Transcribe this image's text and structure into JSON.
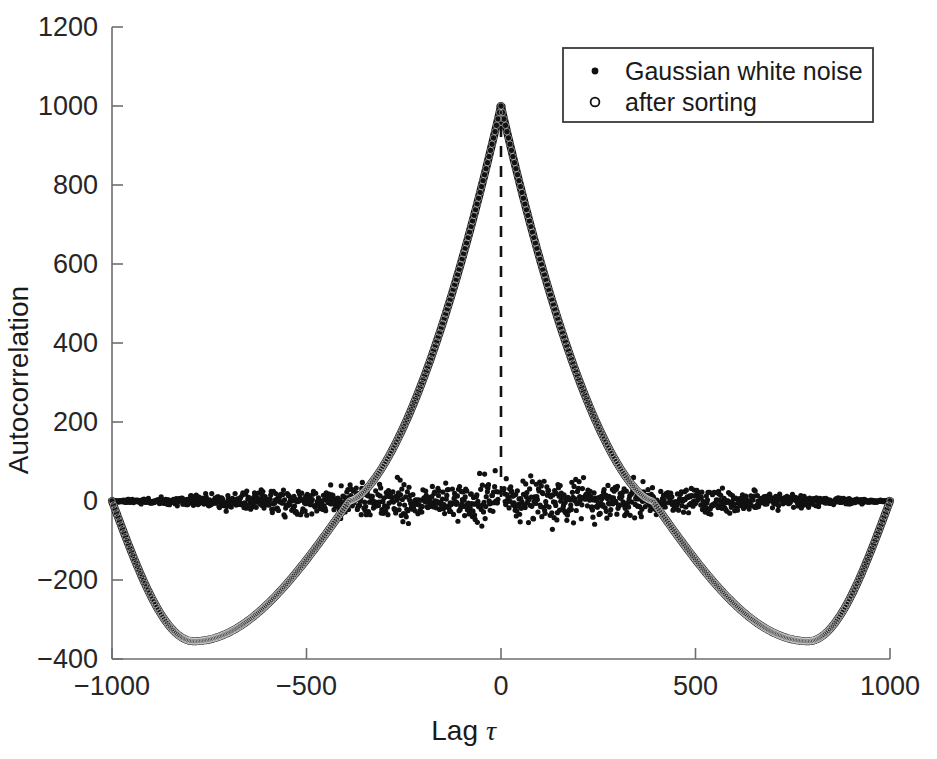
{
  "figure": {
    "background": "#ffffff",
    "ink_color": "#111111",
    "axis_color": "#6e6e6e"
  },
  "chart_data": {
    "type": "scatter",
    "title": "",
    "xlabel_prefix": "Lag",
    "xlabel_symbol": "τ",
    "ylabel": "Autocorrelation",
    "xlim": [
      -1000,
      1000
    ],
    "ylim": [
      -400,
      1200
    ],
    "xticks": [
      -1000,
      -500,
      0,
      500,
      1000
    ],
    "xticklabels": [
      "−1000",
      "−500",
      "0",
      "500",
      "1000"
    ],
    "yticks": [
      -400,
      -200,
      0,
      200,
      400,
      600,
      800,
      1000,
      1200
    ],
    "yticklabels": [
      "−400",
      "−200",
      "0",
      "200",
      "400",
      "600",
      "800",
      "1000",
      "1200"
    ],
    "grid": false,
    "legend_position": "top-right",
    "annotations": [
      {
        "name": "zero-lag-dashed-line",
        "x": 0,
        "y_from": 0,
        "y_to": 1000,
        "style": "dashed"
      }
    ],
    "series": [
      {
        "name": "Gaussian white noise",
        "marker": "filled-dot",
        "marker_size": 3,
        "n_points": 1400,
        "description": "Dense band of scattered points centred on 0, spread roughly ±50, tapering to 0 at the ±1000 edges; narrow spike reaching 1000 at lag 0.",
        "noise_amplitude": 52,
        "peak_value": 1000,
        "peak_lag": 0,
        "baseline": 0
      },
      {
        "name": "after sorting",
        "marker": "open-circle",
        "marker_size": 4,
        "n_points": 520,
        "description": "Smooth triangular-cusp autocorrelation of the sorted ramp: peak 1000 at lag 0, falling steeply, crossing zero near ±390, reaching a minimum of about −355 near lag ±790, returning to 0 at ±1000.",
        "peak_value": 1000,
        "peak_lag": 0,
        "zero_crossings": [
          -390,
          390
        ],
        "minimum_value": -355,
        "minimum_lags": [
          -790,
          790
        ],
        "endpoints_value": 0,
        "key_points": [
          {
            "lag": -1000,
            "value": 0
          },
          {
            "lag": -950,
            "value": -148
          },
          {
            "lag": -900,
            "value": -262
          },
          {
            "lag": -850,
            "value": -326
          },
          {
            "lag": -790,
            "value": -355
          },
          {
            "lag": -700,
            "value": -339
          },
          {
            "lag": -600,
            "value": -276
          },
          {
            "lag": -500,
            "value": -186
          },
          {
            "lag": -390,
            "value": 0
          },
          {
            "lag": -300,
            "value": 148
          },
          {
            "lag": -200,
            "value": 330
          },
          {
            "lag": -100,
            "value": 560
          },
          {
            "lag": -40,
            "value": 790
          },
          {
            "lag": 0,
            "value": 1000
          },
          {
            "lag": 40,
            "value": 790
          },
          {
            "lag": 100,
            "value": 560
          },
          {
            "lag": 200,
            "value": 330
          },
          {
            "lag": 300,
            "value": 148
          },
          {
            "lag": 390,
            "value": 0
          },
          {
            "lag": 500,
            "value": -186
          },
          {
            "lag": 600,
            "value": -276
          },
          {
            "lag": 700,
            "value": -339
          },
          {
            "lag": 790,
            "value": -355
          },
          {
            "lag": 850,
            "value": -326
          },
          {
            "lag": 900,
            "value": -262
          },
          {
            "lag": 950,
            "value": -148
          },
          {
            "lag": 1000,
            "value": 0
          }
        ]
      }
    ]
  },
  "legend": {
    "items": [
      {
        "marker": "filled-dot",
        "label": "Gaussian white noise"
      },
      {
        "marker": "open-circle",
        "label": "after sorting"
      }
    ]
  }
}
